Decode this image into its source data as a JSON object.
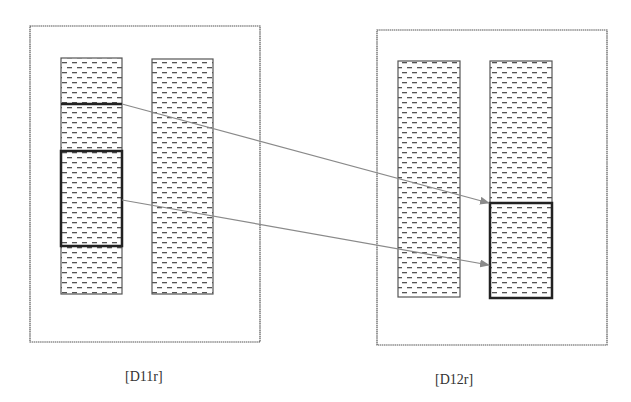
{
  "colors": {
    "panel_border": "#555555",
    "column_border": "#555555",
    "highlight_border": "#222222",
    "dash_fill": "#555555",
    "arrow": "#8a8a8a",
    "label": "#333333"
  },
  "panels": [
    {
      "id": "D11r",
      "label": "[D11r]",
      "rect": {
        "x": 30,
        "y": 26,
        "w": 230,
        "h": 316
      },
      "label_pos": {
        "x": 125,
        "y": 369
      },
      "columns": [
        {
          "x": 61,
          "y": 58,
          "w": 61,
          "h": 236
        },
        {
          "x": 152,
          "y": 59,
          "w": 61,
          "h": 235
        }
      ],
      "highlights": [
        {
          "type": "line",
          "x1": 61,
          "y1": 104,
          "x2": 122,
          "y2": 104
        },
        {
          "type": "box",
          "x": 61,
          "y": 151,
          "w": 61,
          "h": 95
        }
      ]
    },
    {
      "id": "D12r",
      "label": "[D12r]",
      "rect": {
        "x": 377,
        "y": 30,
        "w": 230,
        "h": 315
      },
      "label_pos": {
        "x": 435,
        "y": 372
      },
      "columns": [
        {
          "x": 398,
          "y": 61,
          "w": 62,
          "h": 236
        },
        {
          "x": 490,
          "y": 61,
          "w": 62,
          "h": 237
        }
      ],
      "highlights": [
        {
          "type": "box",
          "x": 490,
          "y": 203,
          "w": 62,
          "h": 95
        }
      ]
    }
  ],
  "arrows": [
    {
      "from": {
        "x": 122,
        "y": 104
      },
      "to": {
        "x": 489,
        "y": 203
      }
    },
    {
      "from": {
        "x": 122,
        "y": 200
      },
      "to": {
        "x": 489,
        "y": 265
      }
    }
  ]
}
